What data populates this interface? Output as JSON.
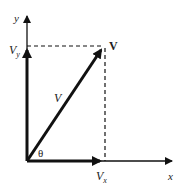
{
  "diagram": {
    "type": "vector-components",
    "labels": {
      "y_axis": "y",
      "x_axis": "x",
      "vy": "V",
      "vy_sub": "y",
      "vx": "V",
      "vx_sub": "x",
      "vector_tip": "V",
      "vector_magnitude": "V",
      "angle": "θ"
    },
    "colors": {
      "ink": "#111111",
      "background": "#ffffff"
    },
    "geometry": {
      "origin": [
        27,
        161
      ],
      "y_axis_tip": [
        27,
        14
      ],
      "x_axis_tip": [
        173,
        161
      ],
      "vector_tip": [
        104,
        47
      ],
      "vx_tip": [
        104,
        161
      ],
      "vy_tip": [
        27,
        47
      ]
    }
  }
}
